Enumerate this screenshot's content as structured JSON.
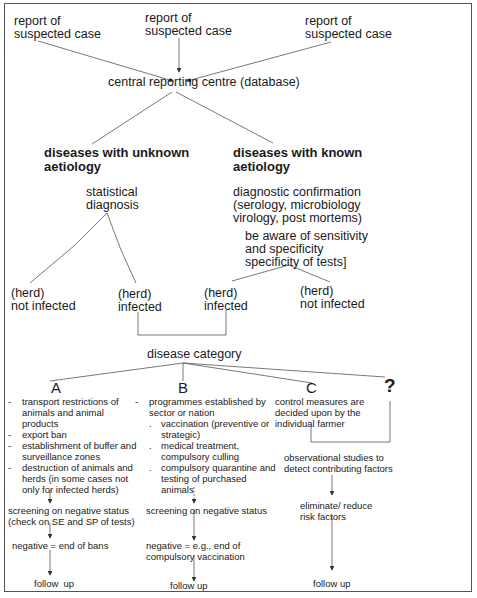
{
  "reports": [
    {
      "label": "report of\nsuspected case"
    },
    {
      "label": "report of\nsuspected case"
    },
    {
      "label": "report of\nsuspected case"
    }
  ],
  "central": "central reporting centre (database)",
  "unknown": {
    "title": "diseases with unknown\naetiology",
    "diagnosis": "statistical\ndiagnosis",
    "not_infected": "(herd)\nnot infected",
    "infected": "(herd)\ninfected"
  },
  "known": {
    "title": "diseases with known\naetiology",
    "diagnosis": "diagnostic confirmation\n(serology, microbiology\nvirology, post mortems)",
    "note": "be aware of sensitivity\nand specificity\nspecificity of tests]",
    "infected": "(herd)\ninfected",
    "not_infected": "(herd)\nnot infected"
  },
  "disease_category": "disease category",
  "categories": {
    "A": {
      "letter": "A",
      "items": [
        "transport restrictions of animals and animal products",
        "export ban",
        "establishment of buffer and surveillance zones",
        "destruction of animals and herds (in some cases not only for infected herds)"
      ],
      "bullet": "-",
      "screening": "screening on negative status\n(check on SE and SP of tests)",
      "negative": "negative = end of bans",
      "follow_up": "follow  up"
    },
    "B": {
      "letter": "B",
      "intro": "programmes established by sector or nation",
      "items": [
        "vaccination (preventive or strategic)",
        "medical treatment, compulsory culling",
        "compulsory quarantine and testing of purchased animals"
      ],
      "bullet": "-",
      "sub_bullet": ".",
      "screening": "screening on negative status",
      "negative": "negative = e.g., end of\ncompulsory vaccination",
      "follow_up": "follow up"
    },
    "C": {
      "letter": "C",
      "text": "control measures are decided upon by the individual farmer"
    },
    "unknown": {
      "letter": "?",
      "studies": "observational studies to\ndetect contributing factors",
      "eliminate": "eliminate/ reduce\nrisk factors",
      "follow_up": "follow up"
    }
  },
  "colors": {
    "line": "#555555",
    "text": "#1a1a1a",
    "border": "#555555"
  }
}
